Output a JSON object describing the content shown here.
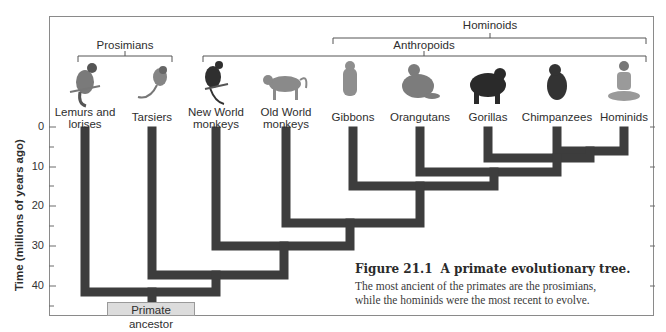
{
  "figure": {
    "number": "Figure 21.1",
    "title": "A primate evolutionary tree.",
    "caption_line1": "The most ancient of the primates are the prosimians,",
    "caption_line2": "while the hominids were the most recent to evolve."
  },
  "axis": {
    "title": "Time (millions of years ago)",
    "ticks": [
      "0",
      "10",
      "20",
      "30",
      "40"
    ]
  },
  "groups": {
    "prosimians": "Prosimians",
    "anthropoids": "Anthropoids",
    "hominoids": "Hominoids"
  },
  "taxa": [
    {
      "line1": "Lemurs and",
      "line2": "lorises",
      "icon": "lemur-icon"
    },
    {
      "line1": "Tarsiers",
      "line2": "",
      "icon": "tarsier-icon"
    },
    {
      "line1": "New World",
      "line2": "monkeys",
      "icon": "new-world-monkey-icon"
    },
    {
      "line1": "Old World",
      "line2": "monkeys",
      "icon": "old-world-monkey-icon"
    },
    {
      "line1": "Gibbons",
      "line2": "",
      "icon": "gibbon-icon"
    },
    {
      "line1": "Orangutans",
      "line2": "",
      "icon": "orangutan-icon"
    },
    {
      "line1": "Gorillas",
      "line2": "",
      "icon": "gorilla-icon"
    },
    {
      "line1": "Chimpanzees",
      "line2": "",
      "icon": "chimpanzee-icon"
    },
    {
      "line1": "Hominids",
      "line2": "",
      "icon": "hominid-icon"
    }
  ],
  "root_label": "Primate ancestor",
  "colors": {
    "branch": "#3d3d3d",
    "frame": "#8a8a8a",
    "root_box": "#dcdcdc"
  },
  "divergences_mya": [
    {
      "join": "Chimpanzees + Hominids",
      "time": 6
    },
    {
      "join": "Gorillas + (Chimpanzees, Hominids)",
      "time": 8
    },
    {
      "join": "Orangutans + African apes",
      "time": 11
    },
    {
      "join": "Gibbons + great apes",
      "time": 15
    },
    {
      "join": "Old World monkeys + apes",
      "time": 24
    },
    {
      "join": "New World monkeys + Old World lineage",
      "time": 30
    },
    {
      "join": "Tarsiers + anthropoids",
      "time": 37
    },
    {
      "join": "Lemurs and lorises + all others",
      "time": 41
    }
  ]
}
